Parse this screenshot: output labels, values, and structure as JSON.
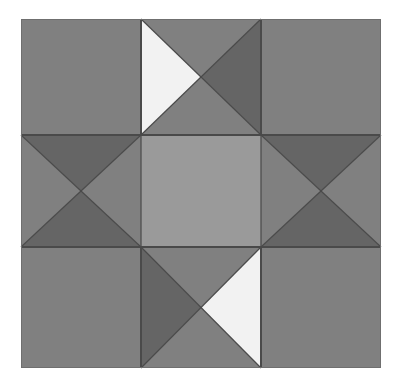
{
  "artwork": {
    "title": "Quilt Block Pattern",
    "kind": "pieced-quilt-block",
    "block_name": "Ohio Star",
    "background_color": "#ffffff",
    "canvas": {
      "width": 401,
      "height": 389
    }
  },
  "palette": {
    "medium_gray": "#808080",
    "dark_gray": "#656565",
    "light_gray": "#9a9a9a",
    "white_cream": "#f2f2f2",
    "seam_line": "#4a4a4a",
    "outer_border": "#6f6f6f"
  },
  "block": {
    "x": 21,
    "y": 19,
    "width": 360,
    "height": 349,
    "columns": 3,
    "rows": 3,
    "grid_x": [
      21,
      141,
      261,
      381
    ],
    "grid_y": [
      19,
      135,
      247,
      368
    ]
  },
  "cells": [
    {
      "id": "cell-top-left",
      "name": "corner-patch-top-left",
      "row": 0,
      "col": 0,
      "type": "solid-square",
      "pieces": [
        {
          "position": "whole",
          "color": "#808080"
        }
      ]
    },
    {
      "id": "cell-top-center",
      "name": "hourglass-patch-top-center",
      "row": 0,
      "col": 1,
      "type": "quarter-square-triangle",
      "pieces": [
        {
          "position": "top",
          "color": "#808080"
        },
        {
          "position": "right",
          "color": "#656565"
        },
        {
          "position": "bottom",
          "color": "#808080"
        },
        {
          "position": "left",
          "color": "#f2f2f2"
        }
      ]
    },
    {
      "id": "cell-top-right",
      "name": "corner-patch-top-right",
      "row": 0,
      "col": 2,
      "type": "solid-square",
      "pieces": [
        {
          "position": "whole",
          "color": "#808080"
        }
      ]
    },
    {
      "id": "cell-middle-left",
      "name": "hourglass-patch-middle-left",
      "row": 1,
      "col": 0,
      "type": "quarter-square-triangle",
      "pieces": [
        {
          "position": "top",
          "color": "#656565"
        },
        {
          "position": "right",
          "color": "#808080"
        },
        {
          "position": "bottom",
          "color": "#656565"
        },
        {
          "position": "left",
          "color": "#808080"
        }
      ]
    },
    {
      "id": "cell-center",
      "name": "center-patch",
      "row": 1,
      "col": 1,
      "type": "solid-square",
      "pieces": [
        {
          "position": "whole",
          "color": "#9a9a9a"
        }
      ]
    },
    {
      "id": "cell-middle-right",
      "name": "hourglass-patch-middle-right",
      "row": 1,
      "col": 2,
      "type": "quarter-square-triangle",
      "pieces": [
        {
          "position": "top",
          "color": "#656565"
        },
        {
          "position": "right",
          "color": "#808080"
        },
        {
          "position": "bottom",
          "color": "#656565"
        },
        {
          "position": "left",
          "color": "#808080"
        }
      ]
    },
    {
      "id": "cell-bottom-left",
      "name": "corner-patch-bottom-left",
      "row": 2,
      "col": 0,
      "type": "solid-square",
      "pieces": [
        {
          "position": "whole",
          "color": "#808080"
        }
      ]
    },
    {
      "id": "cell-bottom-center",
      "name": "hourglass-patch-bottom-center",
      "row": 2,
      "col": 1,
      "type": "quarter-square-triangle",
      "pieces": [
        {
          "position": "top",
          "color": "#808080"
        },
        {
          "position": "right",
          "color": "#f2f2f2"
        },
        {
          "position": "bottom",
          "color": "#808080"
        },
        {
          "position": "left",
          "color": "#656565"
        }
      ]
    },
    {
      "id": "cell-bottom-right",
      "name": "corner-patch-bottom-right",
      "row": 2,
      "col": 2,
      "type": "solid-square",
      "pieces": [
        {
          "position": "whole",
          "color": "#808080"
        }
      ]
    }
  ]
}
